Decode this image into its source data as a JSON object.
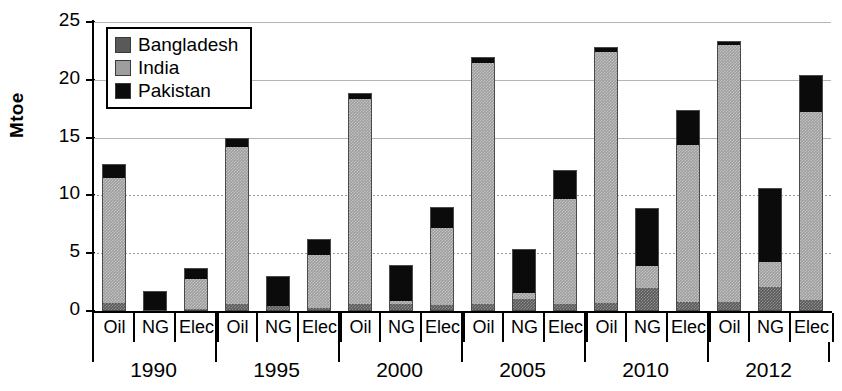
{
  "chart_data": {
    "type": "bar",
    "stacked": true,
    "title": "",
    "xlabel": "",
    "ylabel": "Mtoe",
    "ylim": [
      0,
      25
    ],
    "yticks": [
      0,
      5,
      10,
      15,
      20,
      25
    ],
    "grid": "horizontal",
    "legend_position": "top-left",
    "legend": [
      "Bangladesh",
      "India",
      "Pakistan"
    ],
    "colors": {
      "Bangladesh": "#595959",
      "India": "#9e9e9e",
      "Pakistan": "#0b0b0b",
      "axis": "#000000",
      "gridline": "#b4b4b4",
      "background": "#ffffff"
    },
    "groups": [
      "1990",
      "1995",
      "2000",
      "2005",
      "2010",
      "2012"
    ],
    "fuels": [
      "Oil",
      "NG",
      "Elec"
    ],
    "categories": [
      "1990 Oil",
      "1990 NG",
      "1990 Elec",
      "1995 Oil",
      "1995 NG",
      "1995 Elec",
      "2000 Oil",
      "2000 NG",
      "2000 Elec",
      "2005 Oil",
      "2005 NG",
      "2005 Elec",
      "2010 Oil",
      "2010 NG",
      "2010 Elec",
      "2012 Oil",
      "2012 NG",
      "2012 Elec"
    ],
    "series": [
      {
        "name": "Bangladesh",
        "values": [
          0.6,
          0.0,
          0.1,
          0.5,
          0.4,
          0.2,
          0.5,
          0.5,
          0.4,
          0.5,
          1.0,
          0.5,
          0.6,
          1.9,
          0.7,
          0.7,
          2.0,
          0.9
        ]
      },
      {
        "name": "India",
        "values": [
          11.0,
          0.0,
          2.7,
          13.8,
          0.0,
          4.7,
          17.9,
          0.3,
          6.8,
          21.0,
          0.5,
          9.2,
          21.9,
          2.0,
          13.7,
          22.4,
          2.2,
          16.4
        ]
      },
      {
        "name": "Pakistan",
        "values": [
          1.1,
          1.7,
          0.9,
          0.7,
          2.6,
          1.3,
          0.5,
          3.2,
          1.8,
          0.5,
          3.9,
          2.5,
          0.3,
          5.0,
          3.0,
          0.3,
          6.4,
          3.1
        ]
      }
    ],
    "totals": [
      12.7,
      1.7,
      3.7,
      15.0,
      3.0,
      6.2,
      18.9,
      4.0,
      9.0,
      22.0,
      5.4,
      12.2,
      22.8,
      8.9,
      17.4,
      23.4,
      10.6,
      20.4
    ]
  },
  "axis": {
    "y_title": "Mtoe",
    "y_tick_labels": [
      "0",
      "5",
      "10",
      "15",
      "20",
      "25"
    ]
  },
  "legend": {
    "items": [
      {
        "label": "Bangladesh",
        "color": "#595959"
      },
      {
        "label": "India",
        "color": "#9e9e9e"
      },
      {
        "label": "Pakistan",
        "color": "#0b0b0b"
      }
    ]
  },
  "xaxis": {
    "fuel_labels": [
      "Oil",
      "NG",
      "Elec",
      "Oil",
      "NG",
      "Elec",
      "Oil",
      "NG",
      "Elec",
      "Oil",
      "NG",
      "Elec",
      "Oil",
      "NG",
      "Elec",
      "Oil",
      "NG",
      "Elec"
    ],
    "group_labels": [
      "1990",
      "1995",
      "2000",
      "2005",
      "2010",
      "2012"
    ]
  }
}
